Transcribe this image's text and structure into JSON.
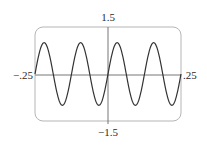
{
  "chart_data": {
    "type": "line",
    "title": "",
    "xlabel": "",
    "ylabel": "",
    "xlim": [
      -0.25,
      0.25
    ],
    "ylim": [
      -1.5,
      1.5
    ],
    "grid": false,
    "legend": null,
    "tick_labels": {
      "x_min": "−.25",
      "x_max": ".25",
      "y_max": "1.5",
      "y_min": "−1.5"
    },
    "series": [
      {
        "name": "y = sin(16πx)",
        "function": "sin(16*pi*x)",
        "amplitude": 1,
        "periods_in_window": 4,
        "x": [
          -0.25,
          -0.21875,
          -0.1875,
          -0.15625,
          -0.125,
          -0.09375,
          -0.0625,
          -0.03125,
          0,
          0.03125,
          0.0625,
          0.09375,
          0.125,
          0.15625,
          0.1875,
          0.21875,
          0.25
        ],
        "y": [
          0,
          1,
          0,
          -1,
          0,
          1,
          0,
          -1,
          0,
          1,
          0,
          -1,
          0,
          1,
          0,
          -1,
          0
        ],
        "color": "#333333"
      }
    ]
  }
}
